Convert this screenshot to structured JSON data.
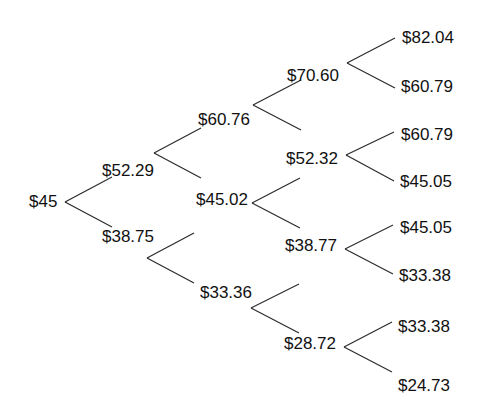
{
  "diagram": {
    "title": "",
    "type": "binomial-price-tree",
    "colors": {
      "line": "#2b2b2b",
      "text": "#111111",
      "background": "#ffffff"
    },
    "nodes": [
      {
        "id": "n0",
        "label": "$45",
        "x": 29,
        "y": 192
      },
      {
        "id": "n1u",
        "label": "$52.29",
        "x": 102,
        "y": 161
      },
      {
        "id": "n1d",
        "label": "$38.75",
        "x": 102,
        "y": 227
      },
      {
        "id": "n2uu",
        "label": "$60.76",
        "x": 198,
        "y": 110
      },
      {
        "id": "n2ud",
        "label": "$45.02",
        "x": 196,
        "y": 190
      },
      {
        "id": "n2dd",
        "label": "$33.36",
        "x": 200,
        "y": 283
      },
      {
        "id": "n3uuu",
        "label": "$70.60",
        "x": 287,
        "y": 66
      },
      {
        "id": "n3uud",
        "label": "$52.32",
        "x": 286,
        "y": 149
      },
      {
        "id": "n3udd",
        "label": "$38.77",
        "x": 285,
        "y": 236
      },
      {
        "id": "n3ddd",
        "label": "$28.72",
        "x": 284,
        "y": 334
      },
      {
        "id": "n4a",
        "label": "$82.04",
        "x": 402,
        "y": 28
      },
      {
        "id": "n4b",
        "label": "$60.79",
        "x": 401,
        "y": 77
      },
      {
        "id": "n4c",
        "label": "$60.79",
        "x": 401,
        "y": 125
      },
      {
        "id": "n4d",
        "label": "$45.05",
        "x": 400,
        "y": 172
      },
      {
        "id": "n4e",
        "label": "$45.05",
        "x": 400,
        "y": 218
      },
      {
        "id": "n4f",
        "label": "$33.38",
        "x": 399,
        "y": 266
      },
      {
        "id": "n4g",
        "label": "$33.38",
        "x": 398,
        "y": 317
      },
      {
        "id": "n4h",
        "label": "$24.73",
        "x": 398,
        "y": 376
      }
    ],
    "edges": [
      {
        "x1": 65,
        "y1": 202,
        "x2": 112,
        "y2": 177
      },
      {
        "x1": 65,
        "y1": 202,
        "x2": 112,
        "y2": 227
      },
      {
        "x1": 154,
        "y1": 153,
        "x2": 201,
        "y2": 128
      },
      {
        "x1": 154,
        "y1": 153,
        "x2": 201,
        "y2": 178
      },
      {
        "x1": 147,
        "y1": 258,
        "x2": 194,
        "y2": 233
      },
      {
        "x1": 147,
        "y1": 258,
        "x2": 194,
        "y2": 283
      },
      {
        "x1": 253,
        "y1": 105,
        "x2": 301,
        "y2": 80
      },
      {
        "x1": 253,
        "y1": 105,
        "x2": 301,
        "y2": 130
      },
      {
        "x1": 252,
        "y1": 203,
        "x2": 300,
        "y2": 178
      },
      {
        "x1": 252,
        "y1": 203,
        "x2": 300,
        "y2": 228
      },
      {
        "x1": 251,
        "y1": 308,
        "x2": 299,
        "y2": 284
      },
      {
        "x1": 251,
        "y1": 308,
        "x2": 299,
        "y2": 333
      },
      {
        "x1": 347,
        "y1": 63,
        "x2": 395,
        "y2": 38
      },
      {
        "x1": 347,
        "y1": 63,
        "x2": 395,
        "y2": 88
      },
      {
        "x1": 346,
        "y1": 155,
        "x2": 394,
        "y2": 132
      },
      {
        "x1": 346,
        "y1": 155,
        "x2": 394,
        "y2": 181
      },
      {
        "x1": 345,
        "y1": 249,
        "x2": 393,
        "y2": 225
      },
      {
        "x1": 345,
        "y1": 249,
        "x2": 393,
        "y2": 274
      },
      {
        "x1": 344,
        "y1": 347,
        "x2": 392,
        "y2": 322
      },
      {
        "x1": 344,
        "y1": 347,
        "x2": 392,
        "y2": 372
      }
    ]
  }
}
